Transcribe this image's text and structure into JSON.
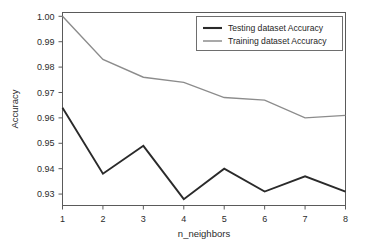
{
  "chart_data": {
    "type": "line",
    "title": "",
    "xlabel": "n_neighbors",
    "ylabel": "Accuracy",
    "x": [
      1,
      2,
      3,
      4,
      5,
      6,
      7,
      8
    ],
    "xtick_labels": [
      "1",
      "2",
      "3",
      "4",
      "5",
      "6",
      "7",
      "8"
    ],
    "ytick_labels": [
      "0.93",
      "0.94",
      "0.95",
      "0.96",
      "0.97",
      "0.98",
      "0.99",
      "1.00"
    ],
    "ytick_values": [
      0.93,
      0.94,
      0.95,
      0.96,
      0.97,
      0.98,
      0.99,
      1.0
    ],
    "xlim": [
      1,
      8
    ],
    "ylim": [
      0.9255,
      1.0015
    ],
    "grid": false,
    "legend_position": "top-right",
    "series": [
      {
        "name": "Testing dataset Accuracy",
        "color": "#2a2a2a",
        "width": 1.9,
        "values": [
          0.964,
          0.938,
          0.949,
          0.928,
          0.94,
          0.931,
          0.937,
          0.931
        ]
      },
      {
        "name": "Training dataset Accuracy",
        "color": "#8c8c8c",
        "width": 1.4,
        "values": [
          1.0,
          0.983,
          0.976,
          0.974,
          0.968,
          0.967,
          0.96,
          0.961
        ]
      }
    ]
  },
  "legend": {
    "entries": [
      {
        "label": "Testing dataset Accuracy"
      },
      {
        "label": "Training dataset Accuracy"
      }
    ]
  },
  "axes": {
    "x_title": "n_neighbors",
    "y_title": "Accuracy"
  },
  "colors": {
    "testing": "#2a2a2a",
    "training": "#8c8c8c",
    "frame": "#5a5a5a",
    "background": "#ffffff"
  }
}
